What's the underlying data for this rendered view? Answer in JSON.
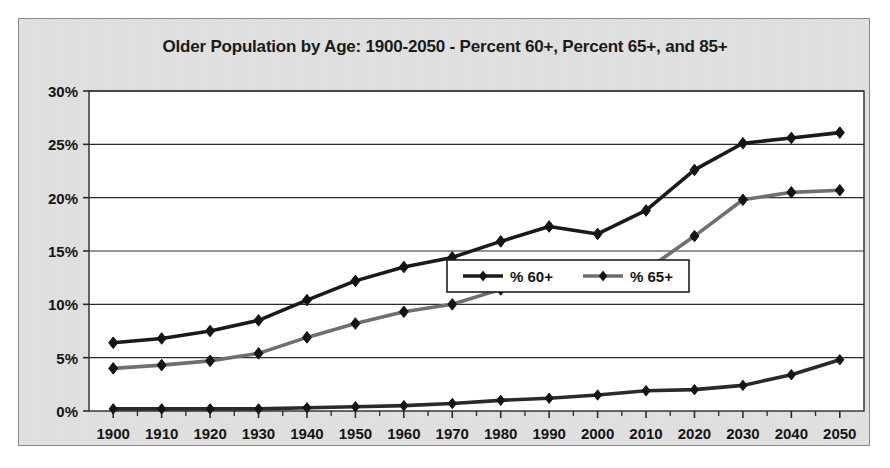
{
  "chart_data": {
    "type": "line",
    "title": "Older Population by Age: 1900-2050 - Percent 60+, Percent 65+, and 85+",
    "xlabel": "",
    "ylabel": "",
    "x": [
      1900,
      1910,
      1920,
      1930,
      1940,
      1950,
      1960,
      1970,
      1980,
      1990,
      2000,
      2010,
      2020,
      2030,
      2040,
      2050
    ],
    "categories": [
      "1900",
      "1910",
      "1920",
      "1930",
      "1940",
      "1950",
      "1960",
      "1970",
      "1980",
      "1990",
      "2000",
      "2010",
      "2020",
      "2030",
      "2040",
      "2050"
    ],
    "series": [
      {
        "name": "% 60+",
        "color": "#1a1a1a",
        "marker": "diamond",
        "values": [
          6.4,
          6.8,
          7.5,
          8.5,
          10.4,
          12.2,
          13.5,
          14.4,
          15.9,
          17.3,
          16.6,
          18.8,
          22.6,
          25.1,
          25.6,
          26.1
        ]
      },
      {
        "name": "% 65+",
        "color": "#6f6f6f",
        "marker": "diamond",
        "values": [
          4.0,
          4.3,
          4.7,
          5.4,
          6.9,
          8.2,
          9.3,
          10.0,
          11.4,
          12.8,
          12.7,
          13.2,
          16.4,
          19.8,
          20.5,
          20.7
        ]
      },
      {
        "name": "85+",
        "color": "#2a2a2a",
        "marker": "diamond",
        "values": [
          0.2,
          0.2,
          0.2,
          0.2,
          0.3,
          0.4,
          0.5,
          0.7,
          1.0,
          1.2,
          1.5,
          1.9,
          2.0,
          2.4,
          3.4,
          4.8
        ]
      }
    ],
    "ylim": [
      0,
      30
    ],
    "yticks": [
      0,
      5,
      10,
      15,
      20,
      25,
      30
    ],
    "ytick_labels": [
      "0%",
      "5%",
      "10%",
      "15%",
      "20%",
      "25%",
      "30%"
    ],
    "grid": "horizontal",
    "legend_position": "inside-center-right",
    "legend_entries": [
      "% 60+",
      "% 65+"
    ],
    "plot_background": "#ffffff",
    "figure_background": "#e2e2e2"
  }
}
